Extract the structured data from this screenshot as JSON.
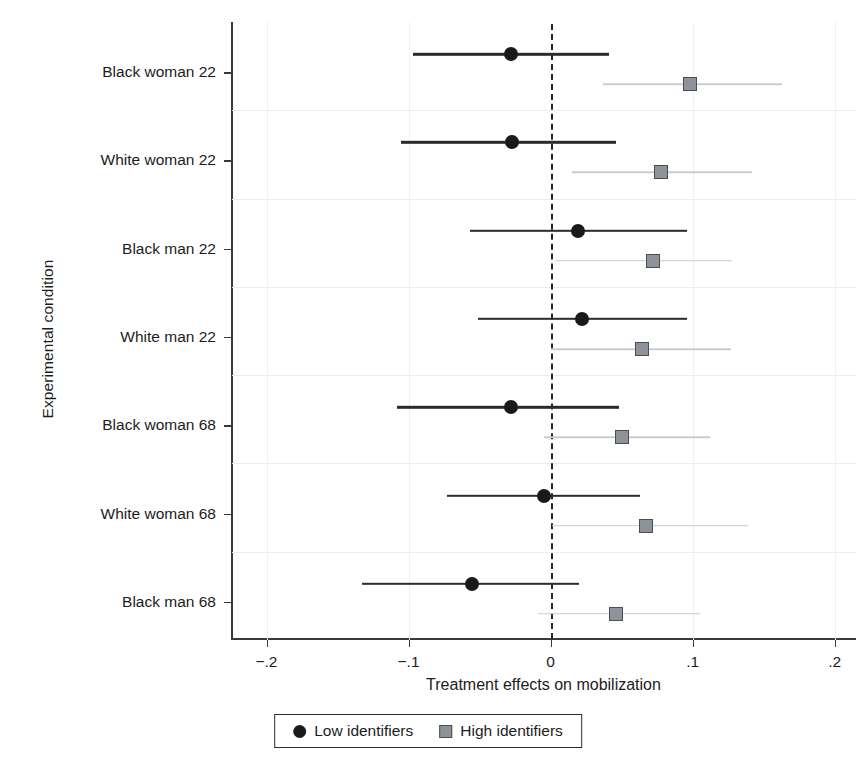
{
  "chart_data": {
    "type": "scatter",
    "title": "",
    "xlabel": "Treatment effects on mobilization",
    "ylabel": "Experimental condition",
    "xlim": [
      -0.225,
      0.215
    ],
    "ylim": [
      0,
      7
    ],
    "grid": true,
    "zero_reference_line": 0,
    "legend_position": "bottom",
    "xticks": [
      -0.2,
      -0.1,
      0,
      0.1,
      0.2
    ],
    "xticklabels": [
      "−.2",
      "−.1",
      "0",
      ".1",
      ".2"
    ],
    "categories": [
      "Black woman 22",
      "White woman 22",
      "Black man 22",
      "White man 22",
      "Black woman 68",
      "White woman 68",
      "Black man 68"
    ],
    "series": [
      {
        "name": "Low identifiers",
        "marker": "circle",
        "color": "#1a1a1a",
        "values": [
          -0.028,
          -0.027,
          0.019,
          0.022,
          -0.028,
          -0.005,
          -0.055
        ],
        "ci_low": [
          -0.097,
          -0.105,
          -0.057,
          -0.051,
          -0.108,
          -0.073,
          -0.133
        ],
        "ci_high": [
          0.041,
          0.046,
          0.096,
          0.096,
          0.048,
          0.063,
          0.02
        ]
      },
      {
        "name": "High identifiers",
        "marker": "square",
        "color": "#8d9398",
        "values": [
          0.098,
          0.078,
          0.072,
          0.064,
          0.05,
          0.067,
          0.046
        ],
        "ci_low": [
          0.037,
          0.015,
          0.003,
          0.0,
          -0.005,
          0.001,
          -0.009
        ],
        "ci_high": [
          0.163,
          0.142,
          0.128,
          0.127,
          0.112,
          0.139,
          0.105
        ]
      }
    ]
  },
  "legend": {
    "entries": [
      {
        "label": "Low identifiers",
        "marker": "circle"
      },
      {
        "label": "High identifiers",
        "marker": "square"
      }
    ]
  },
  "colors": {
    "low_identifiers": "#1a1a1a",
    "high_identifiers": "#8d9398",
    "high_identifiers_ci": "#c9cdd1",
    "axis": "#3a3a3a",
    "gridline": "#eaedf0",
    "background": "#ffffff"
  }
}
